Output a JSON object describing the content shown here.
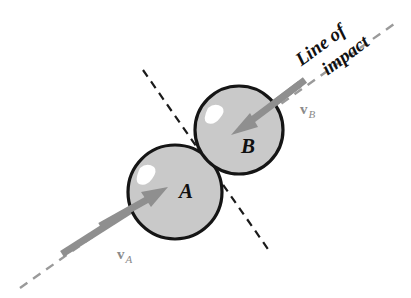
{
  "figure": {
    "name": "oblique-impact-diagram",
    "background_color": "#ffffff",
    "caption_line1": "Line of",
    "caption_line2": "impact"
  },
  "bodies": [
    {
      "id": "sphere-a",
      "label": "A",
      "cx": 175,
      "cy": 192,
      "r": 47,
      "fill": "#c9c9c9",
      "stroke": "#151515"
    },
    {
      "id": "sphere-b",
      "label": "B",
      "cx": 239,
      "cy": 130,
      "r": 44,
      "fill": "#c9c9c9",
      "stroke": "#151515"
    }
  ],
  "vectors": [
    {
      "id": "velocity-a",
      "symbol": "v",
      "subscript": "A",
      "label": "vA",
      "color": "#8f8f8f",
      "direction": "up-right",
      "tail_x": 62,
      "tail_y": 254,
      "tip_x": 166,
      "tip_y": 188,
      "label_x": 117,
      "label_y": 258
    },
    {
      "id": "velocity-b",
      "symbol": "v",
      "subscript": "B",
      "label": "vB",
      "color": "#8f8f8f",
      "direction": "down-left",
      "tail_x": 305,
      "tail_y": 80,
      "tip_x": 234,
      "tip_y": 133,
      "label_x": 303,
      "label_y": 112
    }
  ],
  "lines": [
    {
      "id": "line-of-impact",
      "name": "Line of impact",
      "style": "dashed",
      "color": "#9a9a9a",
      "x1": 20,
      "y1": 288,
      "x2": 394,
      "y2": 24,
      "angle_deg": -35
    },
    {
      "id": "tangent-plane-line",
      "name": "Plane of contact",
      "style": "dashed",
      "color": "#1a1a1a",
      "x1": 143,
      "y1": 70,
      "x2": 270,
      "y2": 252,
      "angle_deg": 55
    }
  ],
  "caption": {
    "text_full": "Line of impact",
    "rotation_deg": -36,
    "x": 333,
    "y": 52
  }
}
